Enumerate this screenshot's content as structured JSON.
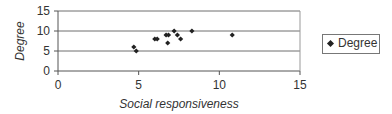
{
  "chart_data": {
    "type": "scatter",
    "title": "",
    "xlabel": "Social responsiveness",
    "ylabel": "Degree",
    "xlim": [
      0,
      15
    ],
    "ylim": [
      0,
      15
    ],
    "x_ticks": [
      "0",
      "5",
      "10",
      "15"
    ],
    "y_ticks": [
      "0",
      "5",
      "10",
      "15"
    ],
    "grid": "horizontal",
    "legend_position": "right",
    "series": [
      {
        "name": "Degree",
        "marker": "diamond",
        "color": "#222222",
        "points": [
          {
            "x": 4.7,
            "y": 6
          },
          {
            "x": 4.85,
            "y": 5
          },
          {
            "x": 6.0,
            "y": 8
          },
          {
            "x": 6.15,
            "y": 8
          },
          {
            "x": 6.7,
            "y": 9
          },
          {
            "x": 6.85,
            "y": 9
          },
          {
            "x": 6.8,
            "y": 7
          },
          {
            "x": 7.2,
            "y": 10
          },
          {
            "x": 7.4,
            "y": 9
          },
          {
            "x": 7.6,
            "y": 8
          },
          {
            "x": 8.3,
            "y": 10
          },
          {
            "x": 10.8,
            "y": 9
          }
        ]
      }
    ]
  },
  "legend": {
    "label": "Degree"
  }
}
